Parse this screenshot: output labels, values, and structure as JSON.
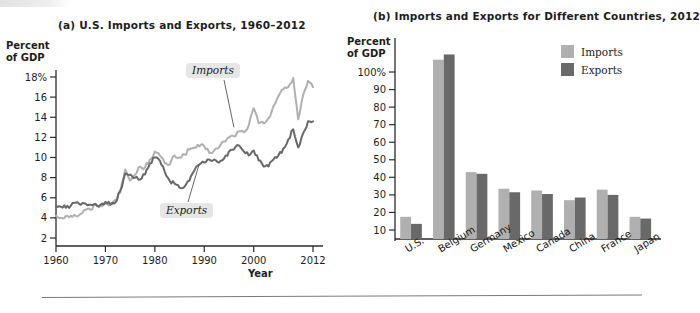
{
  "figure": {
    "bottom_rule": true
  },
  "chart_data": [
    {
      "type": "line",
      "title": "(a) U.S. Imports and Exports, 1960–2012",
      "ylabel": "Percent of GDP",
      "ylabel_line1": "Percent",
      "ylabel_line2": "of GDP",
      "xlabel": "Year",
      "xlim": [
        1960,
        2012
      ],
      "ylim": [
        0,
        19
      ],
      "ytick_labels": [
        "18%",
        "16",
        "14",
        "12",
        "10",
        "8",
        "6",
        "4",
        "2"
      ],
      "yticks": [
        18,
        16,
        14,
        12,
        10,
        8,
        6,
        4,
        2
      ],
      "xtick_labels": [
        "1960",
        "1970",
        "1980",
        "1990",
        "2000",
        "2012"
      ],
      "xticks": [
        1960,
        1970,
        1980,
        1990,
        2000,
        2012
      ],
      "grid": false,
      "annotations": [
        {
          "label": "Imports",
          "points_to_year": 1996,
          "points_to_value": 13.2
        },
        {
          "label": "Exports",
          "points_to_year": 1989,
          "points_to_value": 9.3
        }
      ],
      "series": [
        {
          "name": "Imports",
          "color": "#b0b0b0",
          "x": [
            1960,
            1961,
            1962,
            1963,
            1964,
            1965,
            1966,
            1967,
            1968,
            1969,
            1970,
            1971,
            1972,
            1973,
            1974,
            1975,
            1976,
            1977,
            1978,
            1979,
            1980,
            1981,
            1982,
            1983,
            1984,
            1985,
            1986,
            1987,
            1988,
            1989,
            1990,
            1991,
            1992,
            1993,
            1994,
            1995,
            1996,
            1997,
            1998,
            1999,
            2000,
            2001,
            2002,
            2003,
            2004,
            2005,
            2006,
            2007,
            2008,
            2009,
            2010,
            2011,
            2012
          ],
          "values": [
            4.2,
            4.0,
            4.2,
            4.2,
            4.2,
            4.4,
            4.8,
            4.8,
            5.3,
            5.2,
            5.4,
            5.4,
            5.8,
            6.5,
            8.8,
            7.7,
            8.3,
            9.1,
            9.0,
            9.8,
            10.6,
            10.2,
            9.4,
            9.3,
            10.2,
            10.0,
            10.3,
            10.8,
            11.0,
            11.1,
            11.1,
            10.5,
            10.7,
            11.0,
            11.6,
            12.0,
            12.1,
            12.6,
            12.5,
            13.2,
            14.9,
            13.4,
            13.4,
            13.9,
            15.1,
            16.1,
            16.8,
            17.0,
            17.9,
            13.8,
            16.2,
            17.6,
            17.0
          ]
        },
        {
          "name": "Exports",
          "color": "#696969",
          "x": [
            1960,
            1961,
            1962,
            1963,
            1964,
            1965,
            1966,
            1967,
            1968,
            1969,
            1970,
            1971,
            1972,
            1973,
            1974,
            1975,
            1976,
            1977,
            1978,
            1979,
            1980,
            1981,
            1982,
            1983,
            1984,
            1985,
            1986,
            1987,
            1988,
            1989,
            1990,
            1991,
            1992,
            1993,
            1994,
            1995,
            1996,
            1997,
            1998,
            1999,
            2000,
            2001,
            2002,
            2003,
            2004,
            2005,
            2006,
            2007,
            2008,
            2009,
            2010,
            2011,
            2012
          ],
          "values": [
            5.2,
            5.1,
            5.0,
            5.2,
            5.5,
            5.3,
            5.4,
            5.3,
            5.4,
            5.3,
            5.6,
            5.3,
            5.5,
            6.7,
            8.4,
            8.3,
            8.0,
            7.8,
            8.3,
            9.4,
            10.0,
            9.7,
            8.6,
            7.7,
            7.4,
            7.0,
            7.1,
            7.7,
            8.7,
            9.3,
            9.5,
            9.8,
            9.8,
            9.5,
            9.9,
            10.6,
            10.8,
            11.2,
            10.6,
            10.2,
            10.7,
            9.7,
            9.1,
            9.1,
            9.8,
            10.2,
            10.9,
            11.8,
            12.8,
            11.0,
            12.4,
            13.6,
            13.6
          ]
        }
      ]
    },
    {
      "type": "bar",
      "title": "(b) Imports and Exports for Different Countries, 2012",
      "ylabel": "Percent of GDP",
      "ylabel_line1": "Percent",
      "ylabel_line2": "of GDP",
      "xlabel": "",
      "ylim": [
        0,
        115
      ],
      "ytick_labels": [
        "100%",
        "90",
        "80",
        "70",
        "60",
        "50",
        "40",
        "30",
        "20",
        "10"
      ],
      "yticks": [
        100,
        90,
        80,
        70,
        60,
        50,
        40,
        30,
        20,
        10
      ],
      "grid": false,
      "legend_position": "top-right",
      "categories": [
        "U.S.",
        "Belgium",
        "Germany",
        "Mexico",
        "Canada",
        "China",
        "France",
        "Japan"
      ],
      "series": [
        {
          "name": "Imports",
          "color": "#b0b0b0",
          "values": [
            17.5,
            107.0,
            43.0,
            33.5,
            32.5,
            27.0,
            33.0,
            17.5
          ]
        },
        {
          "name": "Exports",
          "color": "#696969",
          "values": [
            13.5,
            110.0,
            42.0,
            31.5,
            30.5,
            28.5,
            30.0,
            16.5
          ]
        }
      ]
    }
  ]
}
